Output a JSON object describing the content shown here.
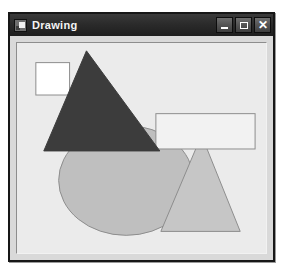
{
  "window": {
    "title": "Drawing",
    "app_icon": "drawing-app-icon",
    "controls": [
      {
        "name": "minimize-button",
        "glyph": "–",
        "label": "Minimize"
      },
      {
        "name": "maximize-button",
        "glyph": "□",
        "label": "Maximize"
      },
      {
        "name": "close-button",
        "glyph": "✕",
        "label": "Close"
      }
    ]
  },
  "canvas": {
    "background_color": "#ebebeb",
    "width": 251,
    "height": 214,
    "shapes": [
      {
        "name": "ellipse-shape",
        "type": "ellipse",
        "cx": 110,
        "cy": 140,
        "rx": 68,
        "ry": 56,
        "fill": "#bfbfbf",
        "stroke": "#8c8c8c",
        "stroke_width": 1
      },
      {
        "name": "triangle-light-shape",
        "type": "polygon",
        "points": "186,94 225,192 145,192",
        "fill": "#c6c6c6",
        "stroke": "#8c8c8c",
        "stroke_width": 1
      },
      {
        "name": "rectangle-shape",
        "type": "rect",
        "x": 140,
        "y": 72,
        "width": 100,
        "height": 36,
        "fill": "#f2f2f2",
        "stroke": "#8c8c8c",
        "stroke_width": 1
      },
      {
        "name": "square-shape",
        "type": "rect",
        "x": 19,
        "y": 20,
        "width": 34,
        "height": 33,
        "fill": "#ffffff",
        "stroke": "#8c8c8c",
        "stroke_width": 1
      },
      {
        "name": "triangle-dark-shape",
        "type": "polygon",
        "points": "70,8 144,110 27,110",
        "fill": "#3c3c3c",
        "stroke": "#3c3c3c",
        "stroke_width": 1
      }
    ]
  }
}
